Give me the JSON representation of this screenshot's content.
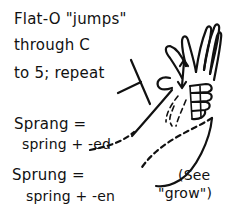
{
  "illustration": {
    "instruction": {
      "line1": "Flat-O \"jumps\"",
      "line2": "through C",
      "line3": "to 5; repeat"
    },
    "sprang": {
      "term": "Sprang =",
      "formula": "spring + -ed"
    },
    "sprung": {
      "term": "Sprung =",
      "formula": "spring + -en"
    },
    "note": {
      "line1": "(See",
      "line2": "\"grow\")"
    },
    "icons": [
      "hand-drawing-icon",
      "up-down-arrow-icon",
      "c-hand-icon",
      "dashed-motion-path-icon"
    ]
  }
}
